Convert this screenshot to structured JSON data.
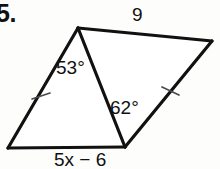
{
  "problem": {
    "number_label": "5.",
    "figure_type": "two-triangles-shared-diagonal"
  },
  "labels": {
    "top_side": "9",
    "angle_upper": "53°",
    "angle_lower": "62°",
    "bottom_side": "5x − 6"
  },
  "colors": {
    "stroke": "#111111",
    "tick_stroke": "#4a4a4a",
    "background": "#fdfdfc",
    "text": "#111111"
  },
  "geometry": {
    "vertices": {
      "top": [
        78,
        28
      ],
      "right": [
        212,
        41
      ],
      "bottom_middle": [
        125,
        147
      ],
      "bottom_left": [
        8,
        148
      ]
    },
    "edges": [
      {
        "name": "top-side",
        "from": "top",
        "to": "right",
        "label": "9"
      },
      {
        "name": "right-side",
        "from": "right",
        "to": "bottom_middle",
        "ticks": 1
      },
      {
        "name": "bottom-side",
        "from": "bottom_middle",
        "to": "bottom_left",
        "label": "5x − 6"
      },
      {
        "name": "left-side",
        "from": "bottom_left",
        "to": "top",
        "ticks": 1
      },
      {
        "name": "shared-diagonal",
        "from": "top",
        "to": "bottom_middle"
      }
    ],
    "tick_marks": [
      {
        "name": "left-side-tick",
        "at": [
          41,
          96
        ]
      },
      {
        "name": "right-side-tick",
        "at": [
          170,
          91
        ]
      }
    ],
    "angles": [
      {
        "name": "angle-at-top-vertex",
        "value": "53°"
      },
      {
        "name": "angle-at-bottom-middle-vertex",
        "value": "62°"
      }
    ]
  }
}
